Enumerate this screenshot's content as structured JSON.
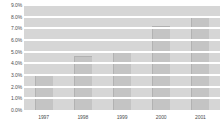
{
  "chart_data": {
    "type": "bar",
    "title": "",
    "subtitle": "",
    "xlabel": "",
    "ylabel": "",
    "categories": [
      "1997",
      "1998",
      "1999",
      "2000",
      "2001"
    ],
    "values": [
      3.0,
      4.6,
      5.1,
      7.2,
      8.1
    ],
    "series": [
      {
        "name": "",
        "values": [
          3.0,
          4.6,
          5.1,
          7.2,
          8.1
        ]
      }
    ],
    "ylim": [
      0.0,
      9.0
    ],
    "ytick_values": [
      0.0,
      1.0,
      2.0,
      3.0,
      4.0,
      5.0,
      6.0,
      7.0,
      8.0,
      9.0
    ],
    "ytick_labels": [
      "0.0%",
      "1.0%",
      "2.0%",
      "3.0%",
      "4.0%",
      "5.0%",
      "6.0%",
      "7.0%",
      "8.0%",
      "9.0%"
    ],
    "grid": true,
    "grid_orientation": "horizontal",
    "legend": false,
    "legend_position": "none",
    "annotations": [],
    "colors": {
      "bar_fill": "#c4c4c4",
      "bar_edge": "#b2b2b2",
      "band_fill": "#d6d6d6",
      "gridline": "#ffffff",
      "plot_background": "#ffffff",
      "tick_label": "#4d4d4d",
      "page_background": "#ffffff"
    }
  }
}
